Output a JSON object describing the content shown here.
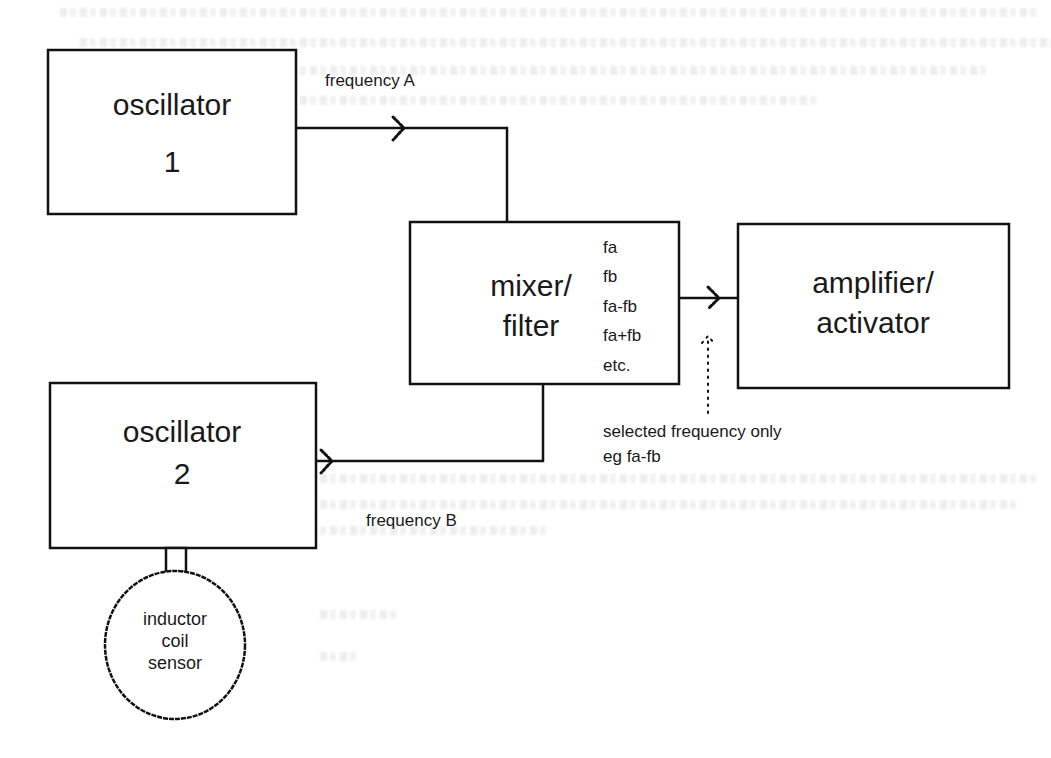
{
  "diagram": {
    "oscillator_1": {
      "line1": "oscillator",
      "line2": "1"
    },
    "oscillator_2": {
      "line1": "oscillator",
      "line2": "2"
    },
    "mixer_filter": {
      "line1": "mixer/",
      "line2": "filter",
      "outputs": [
        "fa",
        "fb",
        "fa-fb",
        "fa+fb",
        "etc."
      ]
    },
    "amplifier": {
      "line1": "amplifier/",
      "line2": "activator"
    },
    "sensor": {
      "line1": "inductor",
      "line2": "coil",
      "line3": "sensor"
    },
    "labels": {
      "frequency_a": "frequency A",
      "frequency_b": "frequency B",
      "selected_line1": "selected frequency only",
      "selected_line2": "eg fa-fb"
    },
    "colors": {
      "ink": "#111111",
      "background": "#ffffff"
    }
  }
}
